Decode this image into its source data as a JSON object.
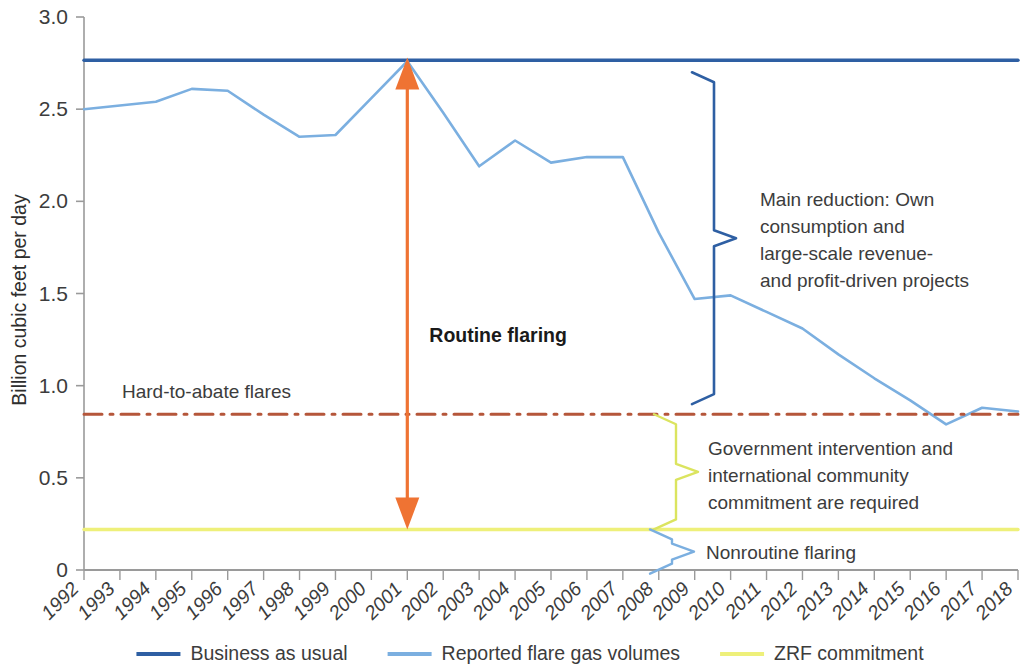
{
  "chart_data": {
    "type": "line",
    "title": "",
    "subtitle": "",
    "xlabel": "",
    "ylabel": "Billion cubic feet per day",
    "xlim": [
      1992,
      2018
    ],
    "ylim": [
      0,
      3.0
    ],
    "grid": false,
    "legend_position": "bottom",
    "y_ticks": [
      "0",
      "0.5",
      "1.0",
      "1.5",
      "2.0",
      "2.5",
      "3.0"
    ],
    "y_tick_values": [
      0,
      0.5,
      1.0,
      1.5,
      2.0,
      2.5,
      3.0
    ],
    "categories": [
      "1992",
      "1993",
      "1994",
      "1995",
      "1996",
      "1997",
      "1998",
      "1999",
      "2000",
      "2001",
      "2002",
      "2003",
      "2004",
      "2005",
      "2006",
      "2007",
      "2008",
      "2009",
      "2010",
      "2011",
      "2012",
      "2013",
      "2014",
      "2015",
      "2016",
      "2017",
      "2018"
    ],
    "series": [
      {
        "name": "Business as usual",
        "color": "#2e5fa3",
        "style": "solid",
        "values": [
          2.765,
          2.765,
          2.765,
          2.765,
          2.765,
          2.765,
          2.765,
          2.765,
          2.765,
          2.765,
          2.765,
          2.765,
          2.765,
          2.765,
          2.765,
          2.765,
          2.765,
          2.765,
          2.765,
          2.765,
          2.765,
          2.765,
          2.765,
          2.765,
          2.765,
          2.765,
          2.765
        ]
      },
      {
        "name": "Reported flare gas volumes",
        "color": "#7bafe0",
        "style": "solid",
        "values": [
          2.5,
          2.52,
          2.54,
          2.61,
          2.6,
          2.47,
          2.35,
          2.36,
          2.56,
          2.76,
          2.48,
          2.19,
          2.33,
          2.21,
          2.24,
          2.24,
          1.83,
          1.47,
          1.49,
          1.4,
          1.31,
          1.17,
          1.04,
          0.92,
          0.79,
          0.88,
          0.86
        ]
      },
      {
        "name": "ZRF commitment",
        "color": "#eef07a",
        "style": "solid",
        "values": [
          0.22,
          0.22,
          0.22,
          0.22,
          0.22,
          0.22,
          0.22,
          0.22,
          0.22,
          0.22,
          0.22,
          0.22,
          0.22,
          0.22,
          0.22,
          0.22,
          0.22,
          0.22,
          0.22,
          0.22,
          0.22,
          0.22,
          0.22,
          0.22,
          0.22,
          0.22,
          0.22
        ]
      },
      {
        "name": "Hard-to-abate flares",
        "color": "#b5563a",
        "style": "dash-dot",
        "in_legend": false,
        "values": [
          0.845,
          0.845,
          0.845,
          0.845,
          0.845,
          0.845,
          0.845,
          0.845,
          0.845,
          0.845,
          0.845,
          0.845,
          0.845,
          0.845,
          0.845,
          0.845,
          0.845,
          0.845,
          0.845,
          0.845,
          0.845,
          0.845,
          0.845,
          0.845,
          0.845,
          0.845,
          0.845
        ]
      }
    ],
    "annotations": [
      {
        "id": "routine-flaring",
        "label": "Routine flaring",
        "type": "double-arrow",
        "color": "#ef7333",
        "x": 2001,
        "y_top": 2.78,
        "y_bottom": 0.22
      },
      {
        "id": "hard-to-abate-flares",
        "label": "Hard-to-abate flares",
        "type": "line-label",
        "color": "#b5563a",
        "y": 0.845
      },
      {
        "id": "main-reduction",
        "label": "Main reduction: Own consumption and large-scale revenue- and profit-driven projects",
        "lines": [
          "Main reduction: Own",
          "consumption and",
          "large-scale revenue-",
          "and profit-driven projects"
        ],
        "type": "brace",
        "color": "#2e5fa3",
        "y_top": 2.7,
        "y_bottom": 0.9
      },
      {
        "id": "government-intervention",
        "label": "Government intervention and international community commitment are required",
        "lines": [
          "Government intervention and",
          "international community",
          "commitment are required"
        ],
        "type": "brace",
        "color": "#dbe45f",
        "y_top": 0.845,
        "y_bottom": 0.22
      },
      {
        "id": "nonroutine-flaring",
        "label": "Nonroutine flaring",
        "lines": [
          "Nonroutine flaring"
        ],
        "type": "brace",
        "color": "#7bafe0",
        "y_top": 0.22,
        "y_bottom": -0.02
      }
    ]
  },
  "legend": {
    "items": [
      {
        "label": "Business as usual",
        "color": "#2e5fa3"
      },
      {
        "label": "Reported flare gas volumes",
        "color": "#7bafe0"
      },
      {
        "label": "ZRF commitment",
        "color": "#eef07a"
      }
    ]
  },
  "axes": {
    "y_title": "Billion cubic feet per day"
  }
}
